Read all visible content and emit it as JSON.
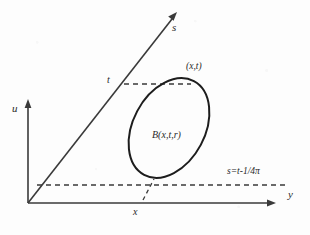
{
  "figure": {
    "type": "mathematical-diagram",
    "background_color": "#fdfdfd",
    "stroke_color": "#3a3a3a",
    "curve_color": "#1d1d1d",
    "axes": [
      {
        "name": "u-axis",
        "label": "u",
        "orientation": "vertical",
        "label_x": 12,
        "label_y": 108,
        "from": [
          28,
          203
        ],
        "to": [
          28,
          101
        ],
        "arrow": "up"
      },
      {
        "name": "y-axis",
        "label": "y",
        "orientation": "horizontal",
        "label_x": 288,
        "label_y": 195,
        "from": [
          28,
          203
        ],
        "to": [
          274,
          203
        ],
        "arrow": "right"
      },
      {
        "name": "s-axis",
        "label": "s",
        "orientation": "diagonal",
        "label_x": 172,
        "label_y": 22,
        "from": [
          28,
          203
        ],
        "to": [
          177,
          13
        ],
        "arrow": "up-right"
      }
    ],
    "labels": [
      {
        "name": "point-label",
        "text": "(x,t)",
        "x": 186,
        "y": 62,
        "style": "label-point"
      },
      {
        "name": "ball-label",
        "text": "B(x,t,r)",
        "x": 152,
        "y": 130,
        "style": "label-region"
      },
      {
        "name": "equation-label",
        "text": "s=t-1/4π",
        "x": 227,
        "y": 167,
        "style": "label-equation"
      },
      {
        "name": "t-tick-label",
        "text": "t",
        "x": 107,
        "y": 75,
        "style": "label-tick"
      },
      {
        "name": "x-tick-label",
        "text": "x",
        "x": 133,
        "y": 207,
        "style": "label-tick"
      }
    ],
    "ellipse": {
      "name": "ball-ellipse",
      "center_x": 169,
      "center_y": 128,
      "radius_x": 36,
      "radius_y": 53,
      "rotation_deg": 28
    },
    "dashed_lines": [
      {
        "name": "t-horizontal-dashed",
        "from": [
          124,
          84
        ],
        "to": [
          191,
          84
        ]
      },
      {
        "name": "s-level-horizontal-dashed",
        "from": [
          37,
          185
        ],
        "to": [
          286,
          185
        ]
      },
      {
        "name": "x-vertical-dashed",
        "from": [
          143,
          199
        ],
        "to": [
          153,
          180
        ]
      }
    ]
  }
}
